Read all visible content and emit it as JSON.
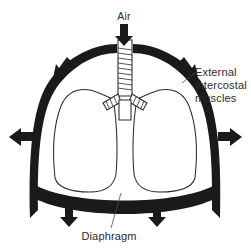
{
  "figure": {
    "background_color": "#ffffff",
    "ink_color": "#1a1a1a",
    "text_color": "#2b2b2b"
  },
  "labels": {
    "air": "Air",
    "external_intercostal_line1": "External",
    "external_intercostal_line2": "intercostal",
    "external_intercostal_line3": "muscles",
    "diaphragm": "Diaphragm"
  },
  "parts": {
    "chest_wall": "chest-wall",
    "left_lung": "left-lung",
    "right_lung": "right-lung",
    "trachea": "trachea",
    "left_bronchus": "left-bronchus",
    "right_bronchus": "right-bronchus",
    "diaphragm_band": "diaphragm"
  },
  "arrows": [
    {
      "name": "air-inflow-arrow",
      "direction": "down",
      "x": 124,
      "y": 33
    },
    {
      "name": "rib-expansion-arrow-upper-left",
      "direction": "up-left",
      "x": 56,
      "y": 66
    },
    {
      "name": "rib-expansion-arrow-upper-right",
      "direction": "up-right",
      "x": 193,
      "y": 66
    },
    {
      "name": "rib-expansion-arrow-left",
      "direction": "left",
      "x": 18,
      "y": 137
    },
    {
      "name": "rib-expansion-arrow-right",
      "direction": "right",
      "x": 231,
      "y": 137
    },
    {
      "name": "diaphragm-descent-arrow-left",
      "direction": "down",
      "x": 69,
      "y": 215
    },
    {
      "name": "diaphragm-descent-arrow-right",
      "direction": "down",
      "x": 157,
      "y": 215
    }
  ]
}
